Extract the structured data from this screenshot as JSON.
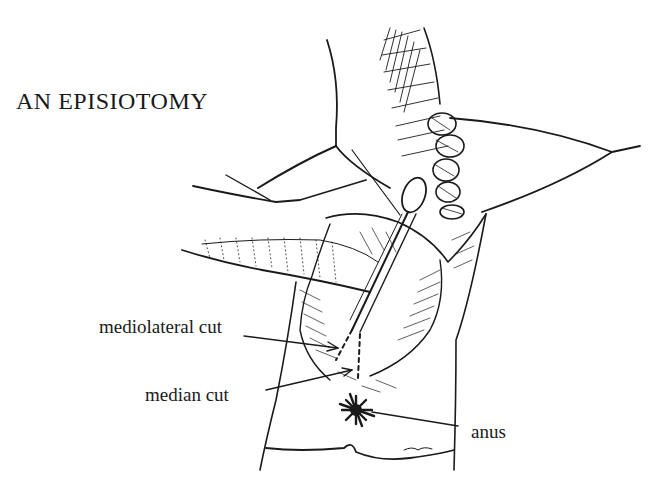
{
  "title": "AN EPISIOTOMY",
  "labels": {
    "mediolateral": "mediolateral cut",
    "median": "median cut",
    "anus": "anus"
  },
  "colors": {
    "ink": "#1a1a1a",
    "paper": "#ffffff"
  }
}
